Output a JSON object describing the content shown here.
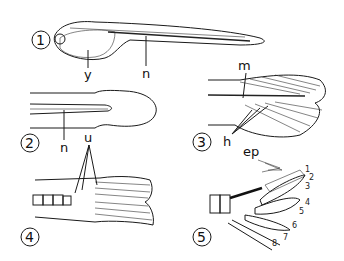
{
  "figure": {
    "panels": [
      {
        "number": "1",
        "labels": [
          "y",
          "n"
        ]
      },
      {
        "number": "2",
        "labels": [
          "n"
        ]
      },
      {
        "number": "3",
        "labels": [
          "m",
          "h"
        ]
      },
      {
        "number": "4",
        "labels": [
          "u"
        ]
      },
      {
        "number": "5",
        "labels": [
          "ep",
          "1",
          "2",
          "3",
          "4",
          "5",
          "6",
          "7",
          "8"
        ]
      }
    ]
  }
}
